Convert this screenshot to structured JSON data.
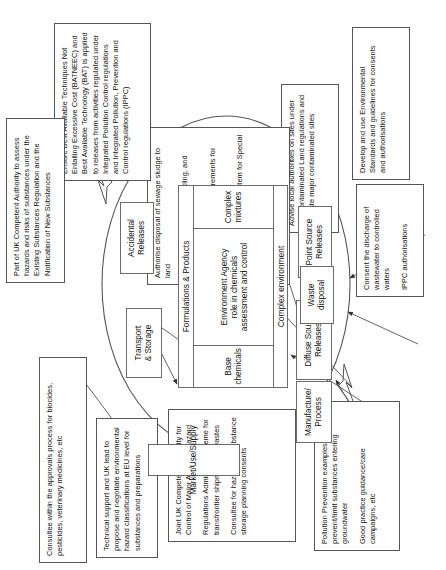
{
  "diagram": {
    "title": "Environment Agency role in chemicals assessment and control",
    "core": {
      "top_band": "Formulations & Products",
      "bottom_band": "Complex environment",
      "center_label_line1": "Environment Agency",
      "center_label_line2": "role in chemicals",
      "center_label_line3": "assessment and control",
      "left_cell": "Base chemicals",
      "right_cell": "Complex mixtures"
    },
    "stages": [
      {
        "id": "market-use-supply",
        "label": "Market/Use/Supply"
      },
      {
        "id": "transport-storage",
        "label": "Transport\n& Storage"
      },
      {
        "id": "accidental-releases",
        "label": "Accidental\nReleases"
      },
      {
        "id": "point-source-releases",
        "label": "Point Source\nReleases"
      },
      {
        "id": "diffuse-source-releases",
        "label": "Diffuse Source\nReleases"
      },
      {
        "id": "waste-disposal",
        "label": "Waste\ndisposal"
      },
      {
        "id": "manufacture-process",
        "label": "Manufacture/\nProcess"
      }
    ],
    "notes": [
      {
        "id": "consultee-approvals",
        "paragraphs": [
          "Consultee within the approvals process for biocides, pesticides, veterinary medicines, etc"
        ]
      },
      {
        "id": "technical-support-classification",
        "paragraphs": [
          "Technical support and UK lead to propose and negotiate environmental hazard classifications at EU  level for substances and preparations"
        ]
      },
      {
        "id": "joint-uk-competent-authority",
        "paragraphs": [
          "Joint UK Competent Authority for Control of Major Accident Hazard",
          "Regulations Administer scheme for transfrontier shipments of wastes",
          "Consultee for hazardous substance storage planning consents"
        ]
      },
      {
        "id": "pollution-prevention",
        "paragraphs": [
          "Pollution Prevention examples: prevent/limit substances entering groundwater",
          "Good practice guidance/care campaigns, etc"
        ]
      },
      {
        "id": "consent-discharge",
        "paragraphs": [
          "Consent  the discharge of wastewater to controlled waters",
          "IPPC authorisations"
        ]
      },
      {
        "id": "environmental-standards",
        "paragraphs": [
          "Develop and use  Environmental Standards and guidelines for consents and authorisations"
        ]
      },
      {
        "id": "contaminated-land",
        "paragraphs": [
          "Advise local authorities on sites under the Contaminated Land regulations and regulate major contaminated sites"
        ]
      },
      {
        "id": "waste-regulation",
        "paragraphs": [
          "Authorise disposal of sewage sludge to land",
          "Promote minimisation, recycling, and processing of waste",
          "Determine operational requirements for landfill sites",
          "Administer consignment system for Special Waste"
        ]
      },
      {
        "id": "bat-batneec-ippc",
        "paragraphs": [
          "Ensure Best Available Techniques Not Entailing Excessive Cost (BATNEEC) and Best Available Technology (BAT) is applied to releases from activities regulated under Integrated Pollution Control regulations and Integrated Pollution, Prevention and Control regulations (IPPC)"
        ]
      },
      {
        "id": "uk-competent-authority-substances",
        "paragraphs": [
          "Part of UK Competent Authority  to assess hazards and risks of substances under  the Existing Substances Regulation and the Notification of New Substances"
        ]
      }
    ],
    "colors": {
      "line": "#555555",
      "box_border": "#555555",
      "pill_border": "#6b6b6b",
      "background": "#ffffff",
      "text": "#111111"
    }
  }
}
